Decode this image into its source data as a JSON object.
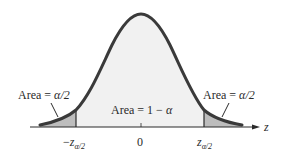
{
  "figure": {
    "type": "standard-normal-distribution",
    "axis_variable": "z",
    "center_tick_label": "0",
    "left_critical_label": {
      "sign": "−",
      "base": "z",
      "sub": "α/2"
    },
    "right_critical_label": {
      "base": "z",
      "sub": "α/2"
    },
    "left_area_label": {
      "prefix": "Area = ",
      "value": "α/2"
    },
    "right_area_label": {
      "prefix": "Area = ",
      "value": "α/2"
    },
    "center_area_label": {
      "prefix": "Area = ",
      "value": "1 − ",
      "alpha": "α"
    },
    "colors": {
      "curve": "#3a3a3a",
      "center_fill": "#f1f1f1",
      "tail_fill": "#bdbdbd",
      "axis": "#2a2a2a"
    }
  }
}
